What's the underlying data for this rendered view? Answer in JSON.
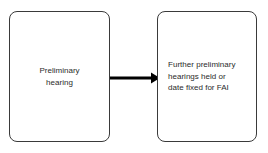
{
  "diagram": {
    "type": "flowchart",
    "background_color": "#ffffff",
    "nodes": [
      {
        "id": "preliminary-hearing",
        "shape": "rounded-rectangle",
        "label": "Preliminary\nhearing",
        "text_align": "center",
        "border_color": "#3a3a3a",
        "fill_color": "#ffffff",
        "text_color": "#2b2b2b"
      },
      {
        "id": "further-hearings",
        "shape": "rounded-rectangle",
        "label": "Further preliminary\nhearings held or\ndate fixed for FAI",
        "text_align": "left",
        "border_color": "#3a3a3a",
        "fill_color": "#ffffff",
        "text_color": "#2b2b2b"
      }
    ],
    "connectors": [
      {
        "id": "arrow-preliminary-to-further",
        "from": "preliminary-hearing",
        "to": "further-hearings",
        "style": "solid-thick",
        "arrowhead": "filled-triangle",
        "color": "#000000",
        "label": ""
      }
    ]
  }
}
